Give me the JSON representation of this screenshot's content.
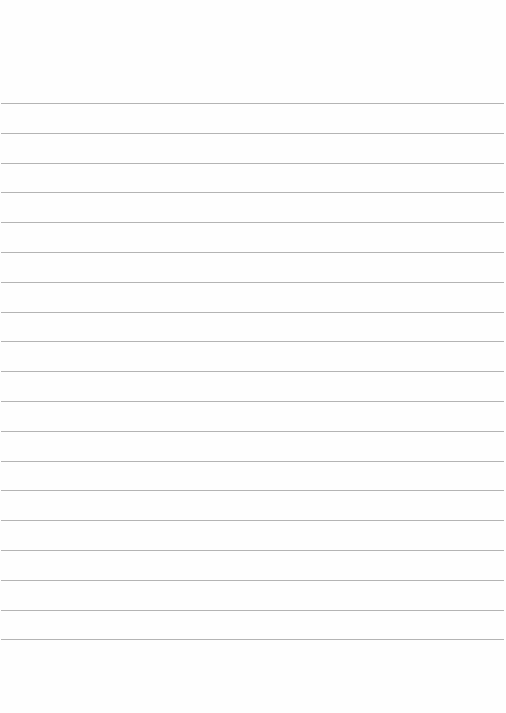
{
  "document": {
    "type": "lined-paper",
    "ruled_line_count": 19,
    "line_color": "#b4b4b4",
    "paper_color": "#fefefe",
    "text": []
  }
}
